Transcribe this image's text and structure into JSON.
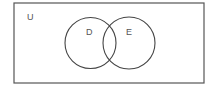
{
  "diagram": {
    "type": "venn",
    "universe": {
      "label": "U",
      "x": 14,
      "y": 3,
      "width": 190,
      "height": 80
    },
    "sets": [
      {
        "label": "D",
        "cx": 90.5,
        "cy": 43,
        "r": 25.5,
        "label_x": 86,
        "label_y": 35
      },
      {
        "label": "E",
        "cx": 129,
        "cy": 43,
        "r": 26,
        "label_x": 126,
        "label_y": 35
      }
    ],
    "colors": {
      "stroke": "#444444",
      "text": "#555555",
      "background": "#ffffff"
    }
  }
}
